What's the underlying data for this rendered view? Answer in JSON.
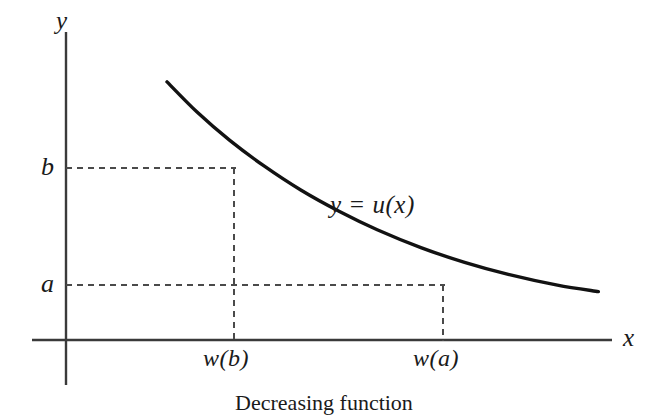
{
  "figure": {
    "caption": "Decreasing function",
    "background_color": "#ffffff",
    "ink_color": "#1a1a1a",
    "axis_color": "#3a3a3a",
    "curve_color": "#121212",
    "dash_color": "#4a4a4a"
  },
  "axes": {
    "y_axis_label": "y",
    "x_axis_label": "x"
  },
  "ticks": {
    "y": [
      {
        "label": "b",
        "value": "b"
      },
      {
        "label": "a",
        "value": "a"
      }
    ],
    "x": [
      {
        "label": "w(b)",
        "value": "w(b)"
      },
      {
        "label": "w(a)",
        "value": "w(a)"
      }
    ]
  },
  "annotations": {
    "curve_label": "y = u(x)"
  },
  "chart_data": {
    "type": "line",
    "title": "Decreasing function",
    "xlabel": "x",
    "ylabel": "y",
    "grid": false,
    "legend": "none",
    "series": [
      {
        "name": "y = u(x)",
        "description": "Strictly decreasing convex curve",
        "points": [
          {
            "x": 0.185,
            "y": 0.838
          },
          {
            "x": 0.24,
            "y": 0.74
          },
          {
            "x": 0.3,
            "y": 0.648
          },
          {
            "x": 0.362,
            "y": 0.566
          },
          {
            "x": 0.43,
            "y": 0.487
          },
          {
            "x": 0.5,
            "y": 0.418
          },
          {
            "x": 0.57,
            "y": 0.358
          },
          {
            "x": 0.65,
            "y": 0.3
          },
          {
            "x": 0.73,
            "y": 0.252
          },
          {
            "x": 0.81,
            "y": 0.213
          },
          {
            "x": 0.9,
            "y": 0.178
          },
          {
            "x": 0.975,
            "y": 0.157
          }
        ]
      }
    ],
    "reference_lines": [
      {
        "axis": "y",
        "label": "b",
        "value": 0.558,
        "from_x": 0.0,
        "to_x": 0.291,
        "style": "dashed"
      },
      {
        "axis": "y",
        "label": "a",
        "value": 0.179,
        "from_x": 0.0,
        "to_x": 0.691,
        "style": "dashed"
      },
      {
        "axis": "x",
        "label": "w(b)",
        "value": 0.291,
        "from_y": 0.0,
        "to_y": 0.558,
        "style": "dashed"
      },
      {
        "axis": "x",
        "label": "w(a)",
        "value": 0.691,
        "from_y": 0.0,
        "to_y": 0.179,
        "style": "dashed"
      }
    ],
    "annotations": [
      {
        "text": "y = u(x)",
        "x": 0.545,
        "y": 0.455
      }
    ],
    "xlim": [
      0,
      1
    ],
    "ylim": [
      0,
      1
    ]
  }
}
